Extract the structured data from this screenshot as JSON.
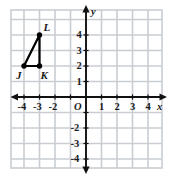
{
  "figure": {
    "kind": "coordinate-plane-with-triangle",
    "width": 171,
    "height": 176
  },
  "chart_data": {
    "type": "scatter",
    "title": "",
    "xlabel": "x",
    "ylabel": "y",
    "xlim": [
      -5,
      5
    ],
    "ylim": [
      -5,
      5
    ],
    "grid": true,
    "legend": false,
    "origin_label": "O",
    "x_ticks": [
      -4,
      -3,
      -2,
      -1,
      0,
      1,
      2,
      3,
      4
    ],
    "x_tick_labels": [
      "-4",
      "-3",
      "-2",
      "",
      "",
      "1",
      "2",
      "3",
      "4"
    ],
    "y_ticks": [
      -4,
      -3,
      -2,
      -1,
      0,
      1,
      2,
      3,
      4
    ],
    "y_tick_labels": [
      "-4",
      "-3",
      "-2",
      "",
      "",
      "1",
      "2",
      "3",
      "4"
    ],
    "series": [
      {
        "name": "Triangle JKL",
        "type": "polygon",
        "closed": true,
        "color": "#000000",
        "points": [
          {
            "label": "J",
            "x": -4,
            "y": 2
          },
          {
            "label": "K",
            "x": -3,
            "y": 2
          },
          {
            "label": "L",
            "x": -3,
            "y": 4
          }
        ]
      }
    ]
  },
  "axes": {
    "x_label": "x",
    "y_label": "y",
    "origin": "O",
    "x_labels": [
      {
        "text": "-4",
        "x": -4
      },
      {
        "text": "-3",
        "x": -3
      },
      {
        "text": "-2",
        "x": -2
      },
      {
        "text": "1",
        "x": 1
      },
      {
        "text": "2",
        "x": 2
      },
      {
        "text": "3",
        "x": 3
      },
      {
        "text": "4",
        "x": 4
      }
    ],
    "y_labels": [
      {
        "text": "4",
        "y": 4
      },
      {
        "text": "3",
        "y": 3
      },
      {
        "text": "2",
        "y": 2
      },
      {
        "text": "1",
        "y": 1
      },
      {
        "text": "-2",
        "y": -2
      },
      {
        "text": "-3",
        "y": -3
      },
      {
        "text": "-4",
        "y": -4
      }
    ]
  },
  "vertices": [
    {
      "name": "J",
      "x": -4,
      "y": 2
    },
    {
      "name": "K",
      "x": -3,
      "y": 2
    },
    {
      "name": "L",
      "x": -3,
      "y": 4
    }
  ],
  "colors": {
    "grid_line": "#c9cdd2",
    "axis_line": "#111111",
    "shape_stroke": "#000000",
    "background": "#ffffff",
    "text": "#1a1a1a"
  }
}
